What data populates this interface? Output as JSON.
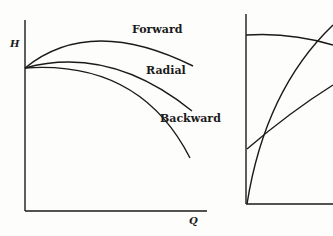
{
  "left_chart": {
    "y_axis_label": "H",
    "x_axis_label": "Q",
    "curves": [
      {
        "label": "Forward"
      },
      {
        "label": "Radial"
      },
      {
        "label": "Backward"
      }
    ]
  },
  "right_chart": {
    "curves": [
      "flat-declining",
      "steep-rising",
      "linear-rising"
    ]
  },
  "colors": {
    "line": "#1a1a1a",
    "background": "#fdfdfb"
  }
}
